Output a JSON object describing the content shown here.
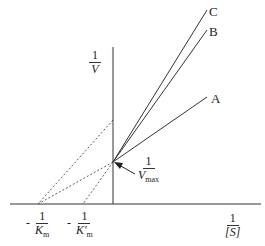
{
  "diagram": {
    "type": "Lineweaver-Burk double reciprocal plot",
    "y_axis_label": {
      "numerator": "1",
      "denominator": "V"
    },
    "x_axis_label": {
      "numerator": "1",
      "denominator": "[S]"
    },
    "intercept_label": {
      "numerator": "1",
      "denominator": "V",
      "subscript": "max"
    },
    "x_intercepts": [
      {
        "sign": "-",
        "numerator": "1",
        "denominator": "K",
        "subscript": "m"
      },
      {
        "sign": "-",
        "numerator": "1",
        "denominator": "K'",
        "subscript": "m"
      }
    ],
    "lines": [
      {
        "label": "C"
      },
      {
        "label": "B"
      },
      {
        "label": "A"
      }
    ],
    "colors": {
      "line": "#333333",
      "background": "#ffffff"
    }
  }
}
